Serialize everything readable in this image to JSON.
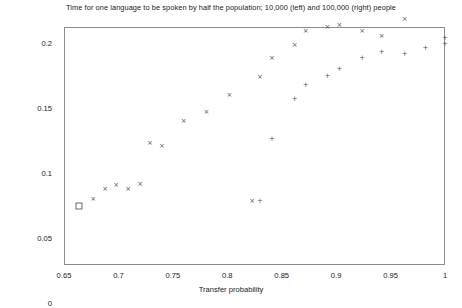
{
  "chart_data": {
    "type": "scatter",
    "title": "Time for one language to be spoken by half the population; 10,000 (left) and 100,000 (right) people",
    "xlabel": "Transfer probability",
    "ylabel": "1/ln(tau)",
    "xlim": [
      0.65,
      1.0
    ],
    "ylim": [
      0,
      0.225
    ],
    "xticks": [
      "0.65",
      "0.7",
      "0.75",
      "0.8",
      "0.85",
      "0.9",
      "0.95",
      "1"
    ],
    "xtick_values": [
      0.65,
      0.7,
      0.75,
      0.8,
      0.85,
      0.9,
      0.95,
      1.0
    ],
    "yticks": [
      "0",
      "0.05",
      "0.1",
      "0.15",
      "0.2"
    ],
    "ytick_values": [
      0,
      0.05,
      0.1,
      0.15,
      0.2
    ],
    "grid": false,
    "legend": "none",
    "series": [
      {
        "name": "10,000 people",
        "marker": "open-square",
        "points": [
          [
            0.663,
            0.0765
          ]
        ]
      },
      {
        "name": "10,000 people (x)",
        "marker": "cross-x",
        "points": [
          [
            0.676,
            0.0812
          ],
          [
            0.687,
            0.0895
          ],
          [
            0.697,
            0.0926
          ],
          [
            0.708,
            0.0895
          ],
          [
            0.719,
            0.0932
          ],
          [
            0.728,
            0.1246
          ],
          [
            0.739,
            0.1222
          ],
          [
            0.759,
            0.1415
          ],
          [
            0.78,
            0.1485
          ],
          [
            0.801,
            0.1615
          ],
          [
            0.822,
            0.08
          ],
          [
            0.829,
            0.1754
          ],
          [
            0.84,
            0.19
          ],
          [
            0.861,
            0.1998
          ],
          [
            0.871,
            0.2108
          ],
          [
            0.891,
            0.2138
          ],
          [
            0.902,
            0.2154
          ],
          [
            0.923,
            0.2108
          ],
          [
            0.941,
            0.2069
          ],
          [
            0.962,
            0.22
          ]
        ]
      },
      {
        "name": "100,000 people",
        "marker": "plus",
        "points": [
          [
            0.829,
            0.08
          ],
          [
            0.84,
            0.1277
          ],
          [
            0.861,
            0.1585
          ],
          [
            0.871,
            0.1692
          ],
          [
            0.891,
            0.1762
          ],
          [
            0.902,
            0.1815
          ],
          [
            0.923,
            0.19
          ],
          [
            0.941,
            0.1946
          ],
          [
            0.962,
            0.1931
          ],
          [
            0.981,
            0.1977
          ],
          [
            0.999,
            0.2008
          ],
          [
            0.999,
            0.2054
          ]
        ]
      }
    ]
  }
}
